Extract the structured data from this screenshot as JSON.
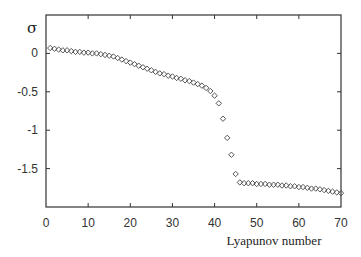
{
  "chart_data": {
    "type": "scatter",
    "title": "",
    "xlabel": "Lyapunov number",
    "ylabel": "σ",
    "xlim": [
      0,
      70
    ],
    "ylim": [
      -2.0,
      0.5
    ],
    "xticks": [
      0,
      10,
      20,
      30,
      40,
      50,
      60,
      70
    ],
    "xtick_labels": [
      "0",
      "10",
      "20",
      "30",
      "40",
      "50",
      "60",
      "70"
    ],
    "yticks": [
      0,
      -0.5,
      -1,
      -1.5
    ],
    "ytick_labels": [
      "0",
      "-0.5",
      "-1",
      "-1.5"
    ],
    "grid": false,
    "legend": null,
    "marker": "diamond",
    "marker_color": "#444444",
    "series": [
      {
        "name": "σ",
        "x": [
          1,
          2,
          3,
          4,
          5,
          6,
          7,
          8,
          9,
          10,
          11,
          12,
          13,
          14,
          15,
          16,
          17,
          18,
          19,
          20,
          21,
          22,
          23,
          24,
          25,
          26,
          27,
          28,
          29,
          30,
          31,
          32,
          33,
          34,
          35,
          36,
          37,
          38,
          39,
          40,
          41,
          42,
          43,
          44,
          45,
          46,
          47,
          48,
          49,
          50,
          51,
          52,
          53,
          54,
          55,
          56,
          57,
          58,
          59,
          60,
          61,
          62,
          63,
          64,
          65,
          66,
          67,
          68,
          69,
          70
        ],
        "values": [
          0.07,
          0.06,
          0.05,
          0.04,
          0.04,
          0.03,
          0.02,
          0.02,
          0.01,
          0.01,
          0.0,
          0.0,
          -0.01,
          -0.02,
          -0.03,
          -0.04,
          -0.06,
          -0.08,
          -0.1,
          -0.12,
          -0.14,
          -0.16,
          -0.18,
          -0.2,
          -0.22,
          -0.24,
          -0.26,
          -0.27,
          -0.29,
          -0.3,
          -0.32,
          -0.33,
          -0.35,
          -0.36,
          -0.38,
          -0.4,
          -0.42,
          -0.45,
          -0.49,
          -0.55,
          -0.65,
          -0.85,
          -1.1,
          -1.32,
          -1.57,
          -1.68,
          -1.69,
          -1.69,
          -1.69,
          -1.7,
          -1.7,
          -1.7,
          -1.71,
          -1.71,
          -1.71,
          -1.72,
          -1.72,
          -1.73,
          -1.73,
          -1.74,
          -1.74,
          -1.75,
          -1.76,
          -1.76,
          -1.77,
          -1.78,
          -1.79,
          -1.8,
          -1.81,
          -1.82
        ]
      }
    ]
  },
  "layout": {
    "plot_left": 46,
    "plot_right": 341,
    "plot_top": 15,
    "plot_bottom": 207
  }
}
